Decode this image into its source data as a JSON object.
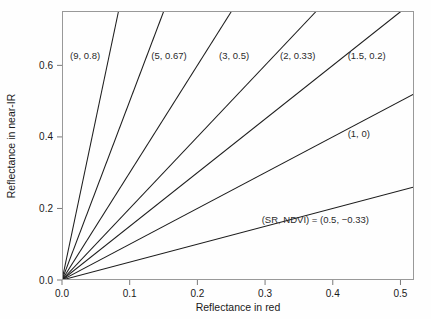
{
  "chart_data": {
    "type": "line",
    "title": "",
    "subtitle": "",
    "xlabel": "Reflectance in red",
    "ylabel": "Reflectance in near-IR",
    "xlim": [
      0.0,
      0.52
    ],
    "ylim": [
      0.0,
      0.752
    ],
    "grid": false,
    "legend_position": "inline-annotations",
    "xticks": [
      0.0,
      0.1,
      0.2,
      0.3,
      0.4,
      0.5
    ],
    "xtick_labels": [
      "0.0",
      "0.1",
      "0.2",
      "0.3",
      "0.4",
      "0.5"
    ],
    "yticks": [
      0.0,
      0.2,
      0.4,
      0.6
    ],
    "ytick_labels": [
      "0.0",
      "0.2",
      "0.4",
      "0.6"
    ],
    "series": [
      {
        "name": "SR = 9",
        "slope": 9,
        "intercept": 0,
        "sr": 9,
        "ndvi": 0.8,
        "label": "(9, 0.8)",
        "label_x": 0.012,
        "label_y": 0.617,
        "label_anchor": "start"
      },
      {
        "name": "SR = 5",
        "slope": 5,
        "intercept": 0,
        "sr": 5,
        "ndvi": 0.67,
        "label": "(5, 0.67)",
        "label_x": 0.132,
        "label_y": 0.617,
        "label_anchor": "start"
      },
      {
        "name": "SR = 3",
        "slope": 3,
        "intercept": 0,
        "sr": 3,
        "ndvi": 0.5,
        "label": "(3, 0.5)",
        "label_x": 0.232,
        "label_y": 0.617,
        "label_anchor": "start"
      },
      {
        "name": "SR = 2",
        "slope": 2,
        "intercept": 0,
        "sr": 2,
        "ndvi": 0.33,
        "label": "(2, 0.33)",
        "label_x": 0.322,
        "label_y": 0.617,
        "label_anchor": "start"
      },
      {
        "name": "SR = 1.5",
        "slope": 1.5,
        "intercept": 0,
        "sr": 1.5,
        "ndvi": 0.2,
        "label": "(1.5, 0.2)",
        "label_x": 0.422,
        "label_y": 0.617,
        "label_anchor": "start"
      },
      {
        "name": "SR = 1",
        "slope": 1,
        "intercept": 0,
        "sr": 1,
        "ndvi": 0,
        "label": "(1, 0)",
        "label_x": 0.422,
        "label_y": 0.401,
        "label_anchor": "start"
      },
      {
        "name": "SR = 0.5",
        "slope": 0.5,
        "intercept": 0,
        "sr": 0.5,
        "ndvi": -0.33,
        "label": "(SR, NDVI) = (0.5, −0.33)",
        "label_x": 0.295,
        "label_y": 0.158,
        "label_anchor": "start"
      }
    ]
  }
}
